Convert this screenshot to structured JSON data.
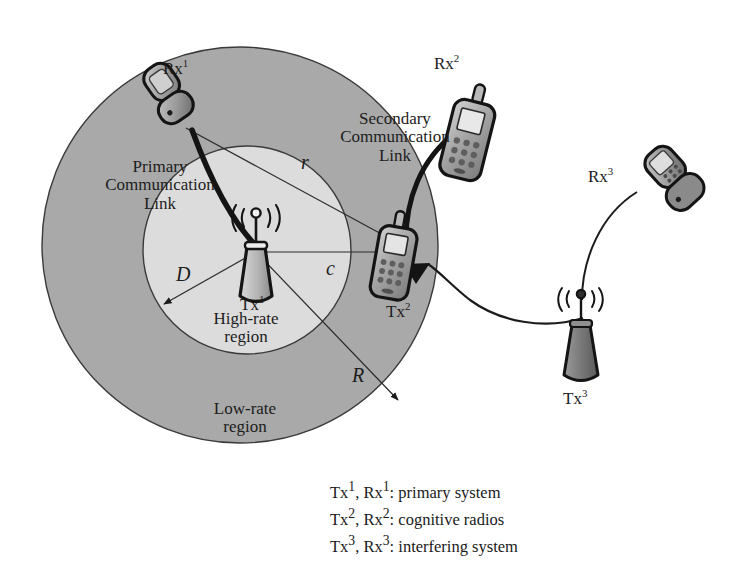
{
  "figure": {
    "background": "#ffffff",
    "colors": {
      "outer_ring_fill": "#a9a9a9",
      "inner_circle_fill": "#dcdcdc",
      "stroke": "#1c1c1c",
      "thin_stroke": "#2b2b2b",
      "device_body": "#8e8e8e",
      "device_light": "#c9c9c9",
      "device_dark": "#6e6e6e"
    },
    "geometry": {
      "outer_circle": {
        "cx": 240,
        "cy": 245,
        "r": 198
      },
      "inner_circle": {
        "cx": 247,
        "cy": 250,
        "r": 104
      }
    }
  },
  "nodes": {
    "rx1": {
      "label": "Rx",
      "sup": "1"
    },
    "tx1": {
      "label": "Tx",
      "sup": "1"
    },
    "rx2": {
      "label": "Rx",
      "sup": "2"
    },
    "tx2": {
      "label": "Tx",
      "sup": "2"
    },
    "rx3": {
      "label": "Rx",
      "sup": "3"
    },
    "tx3": {
      "label": "Tx",
      "sup": "3"
    }
  },
  "links": {
    "primary": {
      "line1": "Primary",
      "line2": "Communication",
      "line3": "Link"
    },
    "secondary": {
      "line1": "Secondary",
      "line2": "Communication",
      "line3": "Link"
    }
  },
  "regions": {
    "high_rate": {
      "line1": "High-rate",
      "line2": "region"
    },
    "low_rate": {
      "line1": "Low-rate",
      "line2": "region"
    }
  },
  "measures": {
    "r": "r",
    "c": "c",
    "D": "D",
    "R": "R"
  },
  "legend": {
    "rows": [
      {
        "tx": "Tx",
        "tx_sup": "1",
        "sep": ", ",
        "rx": "Rx",
        "rx_sup": "1",
        "desc": ": primary system"
      },
      {
        "tx": "Tx",
        "tx_sup": "2",
        "sep": ", ",
        "rx": "Rx",
        "rx_sup": "2",
        "desc": ": cognitive radios"
      },
      {
        "tx": "Tx",
        "tx_sup": "3",
        "sep": ", ",
        "rx": "Rx",
        "rx_sup": "3",
        "desc": ": interfering system"
      }
    ]
  }
}
